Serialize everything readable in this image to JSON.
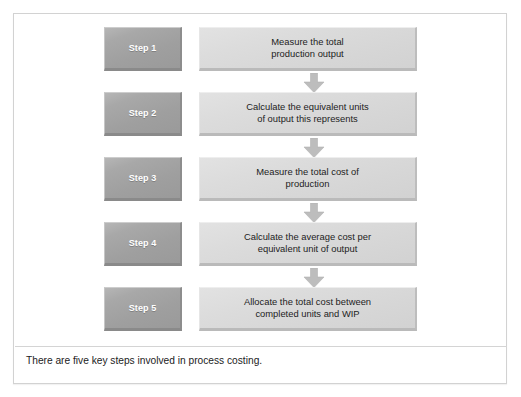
{
  "figure": {
    "caption": "There are five key steps involved in process costing.",
    "colors": {
      "frame_border": "#d2d2d2",
      "step_box_fill": "#a6a6a6",
      "step_box_text": "#ffffff",
      "content_box_fill": "#dadada",
      "content_box_text": "#1d1d1d",
      "arrow_fill": "#bdbdbd",
      "divider": "#d4d4d4",
      "page_background": "#ffffff"
    },
    "steps": [
      {
        "step_label": "Step 1",
        "description": "Measure the total\nproduction output",
        "arrow_after": true
      },
      {
        "step_label": "Step 2",
        "description": "Calculate the equivalent units\nof output this represents",
        "arrow_after": true
      },
      {
        "step_label": "Step 3",
        "description": "Measure the total cost of\nproduction",
        "arrow_after": true
      },
      {
        "step_label": "Step 4",
        "description": "Calculate the average cost per\nequivalent unit of output",
        "arrow_after": true
      },
      {
        "step_label": "Step 5",
        "description": "Allocate the total cost between\ncompleted units and WIP",
        "arrow_after": false
      }
    ]
  }
}
